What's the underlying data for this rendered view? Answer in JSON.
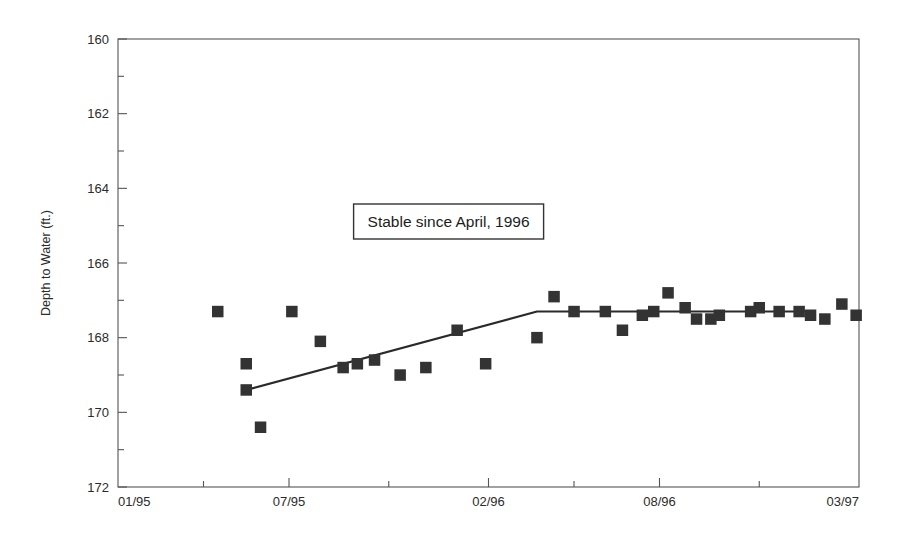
{
  "chart_data": {
    "type": "scatter",
    "title": "",
    "xlabel": "",
    "ylabel": "Depth to Water (ft.)",
    "ylim": [
      160,
      172
    ],
    "y_inverted": true,
    "xlim": [
      "01/95",
      "03/97"
    ],
    "grid": false,
    "legend": null,
    "y_ticks": [
      "160",
      "162",
      "164",
      "166",
      "168",
      "170",
      "172"
    ],
    "y_tick_values": [
      160,
      162,
      164,
      166,
      168,
      170,
      172
    ],
    "y_minor_ticks": [
      161,
      163,
      165,
      167,
      169,
      171
    ],
    "x_ticks": [
      "01/95",
      "07/95",
      "02/96",
      "08/96",
      "03/97"
    ],
    "x_tick_months": [
      0,
      6,
      13,
      19,
      26
    ],
    "x_minor_tick_months": [
      3,
      9.5,
      16,
      22.5
    ],
    "annotations": [
      {
        "text": "Stable since April, 1996",
        "x_month": 11.6,
        "y_value": 164.9,
        "boxed": true
      }
    ],
    "series": [
      {
        "name": "Depth to Water measurements",
        "marker": "square",
        "color": "#333333",
        "points": [
          {
            "x_month": 3.5,
            "y": 167.3
          },
          {
            "x_month": 4.5,
            "y": 169.4
          },
          {
            "x_month": 4.5,
            "y": 168.7
          },
          {
            "x_month": 5.0,
            "y": 170.4
          },
          {
            "x_month": 6.1,
            "y": 167.3
          },
          {
            "x_month": 7.1,
            "y": 168.1
          },
          {
            "x_month": 7.9,
            "y": 168.8
          },
          {
            "x_month": 8.4,
            "y": 168.7
          },
          {
            "x_month": 9.0,
            "y": 168.6
          },
          {
            "x_month": 9.9,
            "y": 169.0
          },
          {
            "x_month": 10.8,
            "y": 168.8
          },
          {
            "x_month": 11.9,
            "y": 167.8
          },
          {
            "x_month": 12.9,
            "y": 168.7
          },
          {
            "x_month": 14.7,
            "y": 168.0
          },
          {
            "x_month": 15.3,
            "y": 166.9
          },
          {
            "x_month": 16.0,
            "y": 167.3
          },
          {
            "x_month": 17.1,
            "y": 167.3
          },
          {
            "x_month": 17.7,
            "y": 167.8
          },
          {
            "x_month": 18.4,
            "y": 167.4
          },
          {
            "x_month": 18.8,
            "y": 167.3
          },
          {
            "x_month": 19.3,
            "y": 166.8
          },
          {
            "x_month": 19.9,
            "y": 167.2
          },
          {
            "x_month": 20.3,
            "y": 167.5
          },
          {
            "x_month": 20.8,
            "y": 167.5
          },
          {
            "x_month": 21.1,
            "y": 167.4
          },
          {
            "x_month": 22.2,
            "y": 167.3
          },
          {
            "x_month": 22.5,
            "y": 167.2
          },
          {
            "x_month": 23.2,
            "y": 167.3
          },
          {
            "x_month": 23.9,
            "y": 167.3
          },
          {
            "x_month": 24.3,
            "y": 167.4
          },
          {
            "x_month": 24.8,
            "y": 167.5
          },
          {
            "x_month": 25.4,
            "y": 167.1
          },
          {
            "x_month": 25.9,
            "y": 167.4
          }
        ]
      }
    ],
    "trend_line": {
      "name": "Piecewise trend",
      "color": "#2a2a2a",
      "points": [
        {
          "x_month": 4.5,
          "y": 169.4
        },
        {
          "x_month": 14.7,
          "y": 167.3
        },
        {
          "x_month": 24.3,
          "y": 167.3
        }
      ]
    }
  },
  "axis": {
    "y_title": "Depth to Water (ft.)"
  }
}
